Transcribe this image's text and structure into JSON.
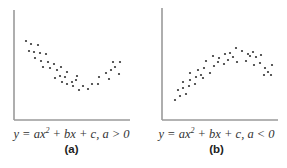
{
  "chart_data": [
    {
      "type": "scatter",
      "title": "",
      "panel_label": "(a)",
      "caption": "y = ax² + bx + c, a > 0",
      "xlabel": "",
      "ylabel": "",
      "grid": false,
      "axes": {
        "x0": 14,
        "y_top": 10,
        "y_axis_bottom": 120,
        "x_end": 130
      },
      "shape": "upward-opening parabola (convex)",
      "points": [
        [
          26,
          41
        ],
        [
          31,
          44
        ],
        [
          38,
          45
        ],
        [
          29,
          51
        ],
        [
          34,
          52
        ],
        [
          40,
          53
        ],
        [
          46,
          54
        ],
        [
          35,
          58
        ],
        [
          41,
          61
        ],
        [
          48,
          62
        ],
        [
          54,
          64
        ],
        [
          43,
          67
        ],
        [
          50,
          68
        ],
        [
          57,
          70
        ],
        [
          61,
          67
        ],
        [
          55,
          78
        ],
        [
          60,
          76
        ],
        [
          65,
          77
        ],
        [
          67,
          72
        ],
        [
          62,
          82
        ],
        [
          67,
          84
        ],
        [
          72,
          82
        ],
        [
          76,
          80
        ],
        [
          79,
          90
        ],
        [
          83,
          86
        ],
        [
          88,
          89
        ],
        [
          92,
          84
        ],
        [
          99,
          77
        ],
        [
          106,
          73
        ],
        [
          111,
          70
        ],
        [
          113,
          62
        ],
        [
          120,
          62
        ],
        [
          98,
          84
        ],
        [
          109,
          79
        ],
        [
          115,
          67
        ],
        [
          119,
          74
        ],
        [
          73,
          86
        ],
        [
          77,
          76
        ]
      ]
    },
    {
      "type": "scatter",
      "title": "",
      "panel_label": "(b)",
      "caption": "y = ax² + bx + c, a < 0",
      "xlabel": "",
      "ylabel": "",
      "grid": false,
      "axes": {
        "x0": 162,
        "y_top": 8,
        "y_axis_bottom": 120,
        "x_end": 278
      },
      "shape": "downward-opening parabola (concave)",
      "points": [
        [
          175,
          100
        ],
        [
          180,
          96
        ],
        [
          186,
          94
        ],
        [
          178,
          90
        ],
        [
          183,
          88
        ],
        [
          189,
          86
        ],
        [
          195,
          84
        ],
        [
          183,
          82
        ],
        [
          190,
          80
        ],
        [
          196,
          77
        ],
        [
          201,
          75
        ],
        [
          190,
          73
        ],
        [
          198,
          70
        ],
        [
          204,
          68
        ],
        [
          206,
          61
        ],
        [
          203,
          78
        ],
        [
          210,
          73
        ],
        [
          214,
          66
        ],
        [
          218,
          62
        ],
        [
          213,
          56
        ],
        [
          219,
          58
        ],
        [
          225,
          54
        ],
        [
          230,
          53
        ],
        [
          224,
          64
        ],
        [
          228,
          60
        ],
        [
          233,
          57
        ],
        [
          237,
          62
        ],
        [
          236,
          48
        ],
        [
          242,
          51
        ],
        [
          248,
          54
        ],
        [
          253,
          52
        ],
        [
          246,
          61
        ],
        [
          250,
          56
        ],
        [
          256,
          57
        ],
        [
          261,
          55
        ],
        [
          260,
          63
        ],
        [
          265,
          68
        ],
        [
          268,
          72
        ],
        [
          272,
          65
        ],
        [
          264,
          75
        ],
        [
          271,
          75
        ],
        [
          254,
          65
        ]
      ]
    }
  ],
  "captions": {
    "a": {
      "pre": "y = ax",
      "exp": "2",
      "post": " + bx + c, a > 0",
      "label": "(a)"
    },
    "b": {
      "pre": "y = ax",
      "exp": "2",
      "post": " + bx + c, a < 0",
      "label": "(b)"
    }
  },
  "colors": {
    "axis": "#9a9a9a",
    "dot": "#333333",
    "text": "#333333"
  }
}
